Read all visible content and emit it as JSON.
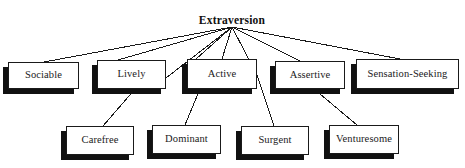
{
  "diagram": {
    "type": "hierarchy-tree",
    "root": {
      "label": "Extraversion",
      "x": 232,
      "y": 14
    },
    "level1": [
      {
        "label": "Sociable",
        "x": 8,
        "y": 62,
        "w": 71,
        "h": 27
      },
      {
        "label": "Lively",
        "x": 97,
        "y": 60,
        "w": 69,
        "h": 29
      },
      {
        "label": "Active",
        "x": 187,
        "y": 59,
        "w": 70,
        "h": 30
      },
      {
        "label": "Assertive",
        "x": 275,
        "y": 61,
        "w": 70,
        "h": 28
      },
      {
        "label": "Sensation-Seeking",
        "x": 356,
        "y": 59,
        "w": 103,
        "h": 30
      }
    ],
    "level2": [
      {
        "label": "Carefree",
        "x": 66,
        "y": 126,
        "w": 68,
        "h": 29
      },
      {
        "label": "Dominant",
        "x": 152,
        "y": 125,
        "w": 69,
        "h": 29
      },
      {
        "label": "Surgent",
        "x": 241,
        "y": 126,
        "w": 68,
        "h": 29
      },
      {
        "label": "Venturesome",
        "x": 329,
        "y": 125,
        "w": 70,
        "h": 29
      }
    ],
    "shadow_offset": {
      "dx": -5,
      "dy": 5
    },
    "colors": {
      "background": "#ffffff",
      "box_fill": "#ffffff",
      "box_border": "#1a1a1a",
      "shadow": "#111111",
      "line": "#1a1a1a",
      "text": "#1a1a1a"
    },
    "edges": [
      {
        "from": "Extraversion",
        "to": "Sociable",
        "x1": 232,
        "y1": 27,
        "x2": 44,
        "y2": 62
      },
      {
        "from": "Extraversion",
        "to": "Lively",
        "x1": 232,
        "y1": 27,
        "x2": 118,
        "y2": 60
      },
      {
        "from": "Extraversion",
        "to": "Lively-right",
        "x1": 232,
        "y1": 27,
        "x2": 166,
        "y2": 78
      },
      {
        "from": "Extraversion",
        "to": "Active-left",
        "x1": 232,
        "y1": 27,
        "x2": 196,
        "y2": 59
      },
      {
        "from": "Extraversion",
        "to": "Active",
        "x1": 232,
        "y1": 27,
        "x2": 222,
        "y2": 59
      },
      {
        "from": "Extraversion",
        "to": "Active-right",
        "x1": 232,
        "y1": 27,
        "x2": 257,
        "y2": 75
      },
      {
        "from": "Extraversion",
        "to": "Assertive",
        "x1": 232,
        "y1": 27,
        "x2": 300,
        "y2": 61
      },
      {
        "from": "Extraversion",
        "to": "Sensation-Seeking",
        "x1": 232,
        "y1": 27,
        "x2": 400,
        "y2": 59
      },
      {
        "from": "Lively",
        "to": "Carefree",
        "x1": 135,
        "y1": 89,
        "x2": 103,
        "y2": 126
      },
      {
        "from": "Active",
        "to": "Dominant",
        "x1": 200,
        "y1": 89,
        "x2": 185,
        "y2": 125
      },
      {
        "from": "Active",
        "to": "Surgent",
        "x1": 257,
        "y1": 75,
        "x2": 274,
        "y2": 126
      },
      {
        "from": "Assertive",
        "to": "Venturesome",
        "x1": 314,
        "y1": 89,
        "x2": 357,
        "y2": 125
      }
    ]
  }
}
